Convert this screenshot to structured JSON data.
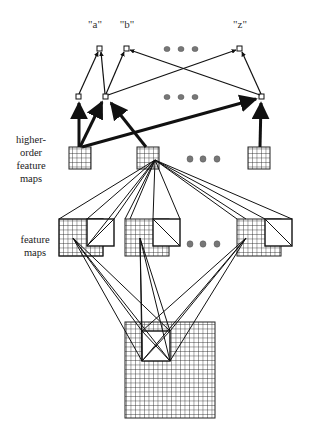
{
  "diagram": {
    "type": "neural-network-architecture",
    "output_labels": [
      "\"a\"",
      "\"b\"",
      "\"z\""
    ],
    "side_labels": {
      "higher_order": [
        "higher-",
        "order",
        "feature",
        "maps"
      ],
      "feature": [
        "feature",
        "maps"
      ]
    },
    "layers": [
      {
        "name": "output-units",
        "count_shown": 3,
        "ellipsis": true
      },
      {
        "name": "hidden-units",
        "count_shown": 3,
        "ellipsis": true
      },
      {
        "name": "higher-order-feature-maps",
        "count_shown": 3,
        "grid": "4x4",
        "ellipsis": true
      },
      {
        "name": "feature-maps",
        "count_shown": 3,
        "grid": "8x8",
        "ellipsis": true
      },
      {
        "name": "input-image",
        "grid": "16x16"
      }
    ],
    "colors": {
      "line": "#222222",
      "background": "#ffffff",
      "ellipsis_dot": "#777777"
    }
  }
}
